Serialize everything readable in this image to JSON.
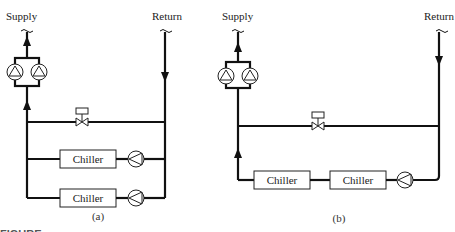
{
  "diagram_a": {
    "supply_label": "Supply",
    "return_label": "Return",
    "chillers": [
      "Chiller",
      "Chiller"
    ],
    "sublabel": "(a)",
    "arrangement": "parallel chillers, each with own pump; bypass with control valve; two parallel distribution pumps on supply"
  },
  "diagram_b": {
    "supply_label": "Supply",
    "return_label": "Return",
    "chillers": [
      "Chiller",
      "Chiller"
    ],
    "sublabel": "(b)",
    "arrangement": "series chillers with single pump; bypass with control valve; two parallel distribution pumps on supply"
  },
  "caption": "FIGURE"
}
